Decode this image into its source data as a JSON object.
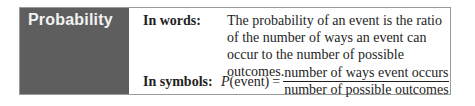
{
  "box": {
    "title": "Probability",
    "colors": {
      "label_background": "#5e5e5e",
      "label_text": "#f2f2f2",
      "border": "#9a9a9a",
      "body_text": "#1e1e1e"
    },
    "words": {
      "term": "In words:",
      "definition": "The probability of an event is the ratio of the number of ways an event can occur to the number of possible outcomes."
    },
    "symbols": {
      "term": "In symbols:",
      "lhs_function": "P",
      "lhs_argument": "(event)",
      "equals": "=",
      "numerator": "number of ways event occurs",
      "denominator": "number of possible outcomes"
    }
  }
}
